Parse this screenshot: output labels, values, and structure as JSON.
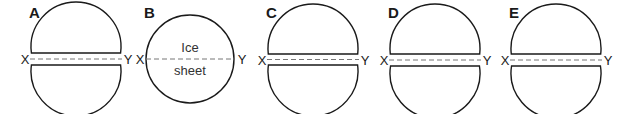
{
  "figure": {
    "panels": [
      {
        "id": "A",
        "label": "A",
        "type": "split",
        "cx": 76,
        "cy": 59,
        "r": 45,
        "gap_top": 53,
        "gap_bottom": 65,
        "line_left": "X",
        "line_right": "Y"
      },
      {
        "id": "B",
        "label": "B",
        "type": "whole",
        "cx": 190,
        "cy": 59,
        "r": 44,
        "line_left": "X",
        "line_right": "Y",
        "text_top": "Ice",
        "text_bottom": "sheet"
      },
      {
        "id": "C",
        "label": "C",
        "type": "split",
        "cx": 313,
        "cy": 59,
        "r": 45,
        "gap_top": 54,
        "gap_bottom": 65,
        "line_left": "X",
        "line_right": "Y"
      },
      {
        "id": "D",
        "label": "D",
        "type": "split",
        "cx": 435,
        "cy": 59,
        "r": 45,
        "gap_top": 54,
        "gap_bottom": 66,
        "line_left": "X",
        "line_right": "Y"
      },
      {
        "id": "E",
        "label": "E",
        "type": "split",
        "cx": 556,
        "cy": 59,
        "r": 45,
        "gap_top": 54,
        "gap_bottom": 66,
        "line_left": "X",
        "line_right": "Y"
      }
    ],
    "colors": {
      "outline": "#1a1a1a",
      "dashed_line": "#777777",
      "background": "#ffffff"
    }
  }
}
